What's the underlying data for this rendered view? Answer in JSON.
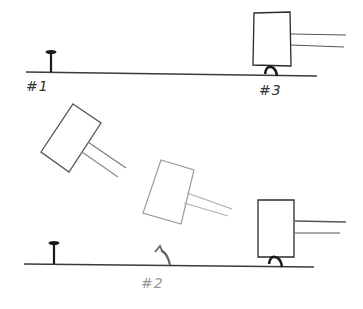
{
  "figure": {
    "colors": {
      "ink": "#2a2a2a",
      "light_ink": "#8a8a8a",
      "faint_ink": "#a8a8a8",
      "background": "#ffffff"
    },
    "labels": {
      "stage_1": "#1",
      "stage_2": "#2",
      "stage_3": "#3"
    },
    "panels": [
      {
        "name": "top",
        "items": [
          "upright-nail #1",
          "hammer over bent nail #3"
        ]
      },
      {
        "name": "bottom",
        "items": [
          "upright-nail",
          "swinging hammer (two positions)",
          "bent nail #2",
          "hammer over bent nail"
        ]
      }
    ]
  }
}
